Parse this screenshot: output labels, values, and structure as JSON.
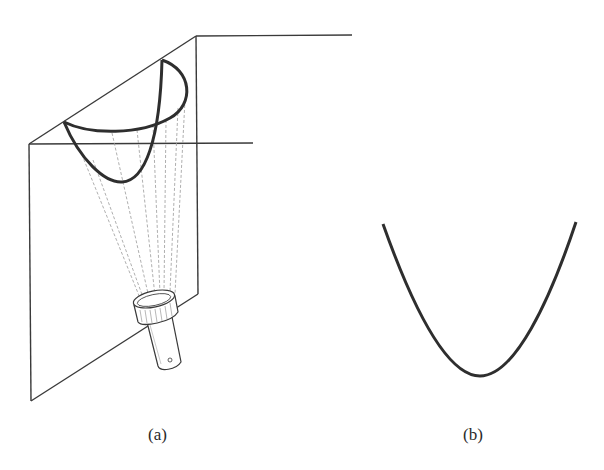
{
  "figure": {
    "panels": [
      {
        "id": "a",
        "caption": "(a)",
        "description": "Flashlight shining onto two perpendicular planes, projecting a cone of light whose intersection with the plane forms a parabola"
      },
      {
        "id": "b",
        "caption": "(b)",
        "description": "Resulting parabola curve"
      }
    ],
    "colors": {
      "line": "#3a3a3a",
      "curve": "#2e2e2e",
      "ray": "#9a9a9a",
      "background": "#ffffff"
    }
  }
}
